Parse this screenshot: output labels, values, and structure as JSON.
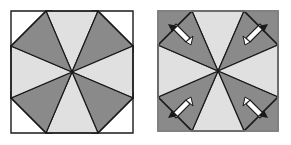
{
  "document": {
    "title": "Paper folding diagram: octagon pinwheel with corner flaps",
    "figure_count": 2
  },
  "colors": {
    "background": "#ffffff",
    "sector_light": "#e0e0e0",
    "sector_dark": "#8a8a8a",
    "outline": "#1a1a1a",
    "square_border": "#7d7d7d",
    "flap_fill": "#ffffff",
    "arrow_fill": "#ffffff",
    "arrow_outline": "#1a1a1a"
  },
  "figures": [
    {
      "id": "figure-unfolded",
      "label": "Unfolded state",
      "description": "Octagon of eight alternating light and dark sectors with four white triangular corner flaps opened outward",
      "center": {
        "x": 72,
        "y": 72
      },
      "octagon_radius": 62,
      "sector_count": 8,
      "sector_fills": [
        "light",
        "dark",
        "light",
        "dark",
        "light",
        "dark",
        "light",
        "dark"
      ],
      "corner_flaps": {
        "count": 4,
        "state": "unfolded-out",
        "fill": "#ffffff",
        "positions": [
          "top-left",
          "top-right",
          "bottom-left",
          "bottom-right"
        ]
      },
      "square_outline_visible": false,
      "arrows": {
        "count": 0
      }
    },
    {
      "id": "figure-folded",
      "label": "Folded state",
      "description": "Square with the same eight sector pinwheel; the four corners are shaded dark where the flaps are folded in, each marked by a white outward arrow",
      "center": {
        "x": 72,
        "y": 71
      },
      "octagon_radius": 60,
      "sector_count": 8,
      "sector_fills": [
        "light",
        "dark",
        "light",
        "dark",
        "light",
        "dark",
        "light",
        "dark"
      ],
      "corner_flaps": {
        "count": 4,
        "state": "folded-in",
        "fill": "#8a8a8a",
        "positions": [
          "top-left",
          "top-right",
          "bottom-left",
          "bottom-right"
        ]
      },
      "square_outline_visible": true,
      "square": {
        "x": 12,
        "y": 11,
        "width": 120,
        "height": 120
      },
      "arrows": {
        "count": 4,
        "direction": "outward-diagonal",
        "style": "white-filled-needle",
        "positions": [
          {
            "corner": "top-left",
            "points": "up-left"
          },
          {
            "corner": "top-right",
            "points": "up-right"
          },
          {
            "corner": "bottom-left",
            "points": "down-left"
          },
          {
            "corner": "bottom-right",
            "points": "down-right"
          }
        ]
      }
    }
  ]
}
